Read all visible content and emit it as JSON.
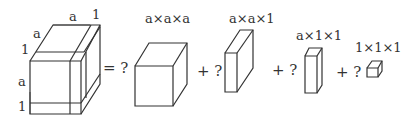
{
  "big_cube": {
    "labels": {
      "top_a": "a",
      "top_1": "1",
      "side_a": "a",
      "side_1": "1",
      "left_a": "a",
      "left_1": "1"
    }
  },
  "pieces": [
    {
      "label": "a×a×a",
      "operator": "= ?"
    },
    {
      "label": "a×a×1",
      "operator": "+ ?"
    },
    {
      "label": "a×1×1",
      "operator": "+ ?"
    },
    {
      "label": "1×1×1",
      "operator": "+ ?"
    }
  ]
}
